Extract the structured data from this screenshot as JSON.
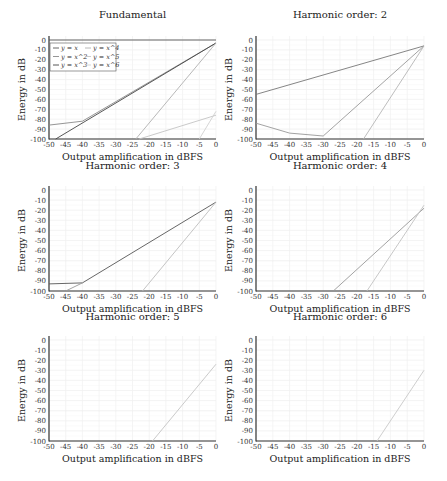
{
  "chart_data": [
    {
      "type": "line",
      "title": "Fundamental",
      "xlabel": "Output amplification in dBFS",
      "ylabel": "Energy in dB",
      "xlim": [
        -50,
        0
      ],
      "ylim": [
        -100,
        0
      ],
      "xticks": [
        -50,
        -45,
        -40,
        -35,
        -30,
        -25,
        -20,
        -15,
        -10,
        -5,
        0
      ],
      "yticks": [
        0,
        -10,
        -20,
        -30,
        -40,
        -50,
        -60,
        -70,
        -80,
        -90,
        -100
      ],
      "grid": true,
      "legend": {
        "position": "upper left",
        "entries": [
          "y = x",
          "y = x^2",
          "y = x^3",
          "y = x^4",
          "y = x^5",
          "y = x^6"
        ]
      },
      "series": [
        {
          "name": "y = x",
          "color": "#555555",
          "points": [
            [
              -50,
              0
            ],
            [
              0,
              0
            ]
          ]
        },
        {
          "name": "y = x^2",
          "color": "#8a8a8a",
          "points": [
            [
              -50,
              -86
            ],
            [
              -40,
              -82
            ],
            [
              0,
              -3
            ]
          ]
        },
        {
          "name": "y = x^3",
          "color": "#444444",
          "points": [
            [
              -48,
              -100
            ],
            [
              0,
              -3
            ]
          ]
        },
        {
          "name": "y = x^4",
          "color": "#b0b0b0",
          "points": [
            [
              -24,
              -100
            ],
            [
              0,
              -3
            ]
          ]
        },
        {
          "name": "y = x^5",
          "color": "#c4c4c4",
          "points": [
            [
              -23,
              -100
            ],
            [
              0,
              -76
            ]
          ]
        },
        {
          "name": "y = x^6",
          "color": "#d0d0d0",
          "points": [
            [
              -5,
              -100
            ],
            [
              0,
              -72
            ]
          ]
        }
      ]
    },
    {
      "type": "line",
      "title": "Harmonic order: 2",
      "xlabel": "Output amplification in dBFS",
      "ylabel": "Energy in dB",
      "xlim": [
        -50,
        0
      ],
      "ylim": [
        -100,
        0
      ],
      "series": [
        {
          "name": "y = x^2",
          "color": "#777777",
          "points": [
            [
              -50,
              -55
            ],
            [
              0,
              -6
            ]
          ]
        },
        {
          "name": "y = x^3",
          "color": "#999999",
          "points": [
            [
              -50,
              -84
            ],
            [
              -40,
              -94
            ],
            [
              -30,
              -97
            ],
            [
              0,
              -6
            ]
          ]
        },
        {
          "name": "y = x^4",
          "color": "#b5b5b5",
          "points": [
            [
              -18,
              -100
            ],
            [
              0,
              -6
            ]
          ]
        }
      ]
    },
    {
      "type": "line",
      "title": "Harmonic order: 3",
      "xlabel": "Output amplification in dBFS",
      "ylabel": "Energy in dB",
      "xlim": [
        -50,
        0
      ],
      "ylim": [
        -100,
        0
      ],
      "series": [
        {
          "name": "y = x^3",
          "color": "#555555",
          "points": [
            [
              -50,
              -93
            ],
            [
              -40,
              -92
            ],
            [
              0,
              -12
            ]
          ]
        },
        {
          "name": "y = x^4",
          "color": "#999999",
          "points": [
            [
              -45,
              -100
            ],
            [
              -40,
              -92
            ]
          ]
        },
        {
          "name": "y = x^5",
          "color": "#bdbdbd",
          "points": [
            [
              -22,
              -100
            ],
            [
              0,
              -12
            ]
          ]
        }
      ]
    },
    {
      "type": "line",
      "title": "Harmonic order: 4",
      "xlabel": "Output amplification in dBFS",
      "ylabel": "Energy in dB",
      "xlim": [
        -50,
        0
      ],
      "ylim": [
        -100,
        0
      ],
      "series": [
        {
          "name": "y = x^4",
          "color": "#999999",
          "points": [
            [
              -27,
              -100
            ],
            [
              0,
              -18
            ]
          ]
        },
        {
          "name": "y = x^5",
          "color": "#c2c2c2",
          "points": [
            [
              -17,
              -100
            ],
            [
              0,
              -15
            ]
          ]
        }
      ]
    },
    {
      "type": "line",
      "title": "Harmonic order: 5",
      "xlabel": "Output amplification in dBFS",
      "ylabel": "Energy in dB",
      "xlim": [
        -50,
        0
      ],
      "ylim": [
        -100,
        0
      ],
      "series": [
        {
          "name": "y = x^5",
          "color": "#c4c4c4",
          "points": [
            [
              -19,
              -100
            ],
            [
              0,
              -24
            ]
          ]
        }
      ]
    },
    {
      "type": "line",
      "title": "Harmonic order: 6",
      "xlabel": "Output amplification in dBFS",
      "ylabel": "Energy in dB",
      "xlim": [
        -50,
        0
      ],
      "ylim": [
        -100,
        0
      ],
      "series": [
        {
          "name": "y = x^6",
          "color": "#c8c8c8",
          "points": [
            [
              -14,
              -100
            ],
            [
              0,
              -30
            ]
          ]
        }
      ]
    }
  ],
  "layout": {
    "panels": [
      {
        "x0": 49,
        "x1": 216,
        "y0": 40,
        "y1": 139,
        "title_y": 14,
        "xlabel_y": 158
      },
      {
        "x0": 256,
        "x1": 424,
        "y0": 40,
        "y1": 139,
        "title_y": 14,
        "xlabel_y": 158
      },
      {
        "x0": 49,
        "x1": 216,
        "y0": 190,
        "y1": 291,
        "title_y": 165,
        "xlabel_y": 310
      },
      {
        "x0": 256,
        "x1": 424,
        "y0": 190,
        "y1": 291,
        "title_y": 165,
        "xlabel_y": 310
      },
      {
        "x0": 49,
        "x1": 216,
        "y0": 340,
        "y1": 441,
        "title_y": 316,
        "xlabel_y": 460
      },
      {
        "x0": 256,
        "x1": 424,
        "y0": 340,
        "y1": 441,
        "title_y": 316,
        "xlabel_y": 460
      }
    ]
  }
}
